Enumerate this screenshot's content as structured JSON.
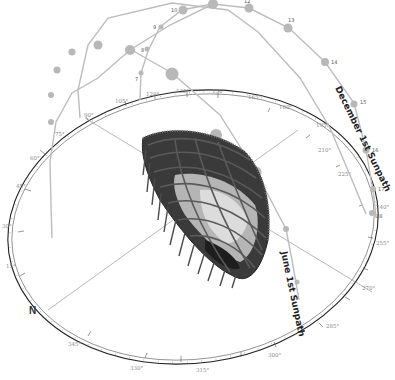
{
  "diagram": {
    "title_north": "N",
    "sunpaths": [
      {
        "name": "December 1st Sunpath",
        "label": "December 1st Sunpath",
        "color": "#bdbdbd"
      },
      {
        "name": "June 1st Sunpath",
        "label": "June 1st Sunpath",
        "color": "#bdbdbd"
      }
    ],
    "hour_labels": {
      "h7": "7",
      "h8": "8",
      "h9": "9",
      "h10": "10",
      "h12": "12",
      "h13": "13",
      "h14": "14",
      "h15": "15",
      "h16": "16",
      "h17": "17",
      "h18": "18"
    },
    "azimuth_labels": {
      "a15": "15°",
      "a30": "30°",
      "a45": "45°",
      "a60": "60°",
      "a75": "75°",
      "a90": "90°",
      "a105": "105°",
      "a120": "120°",
      "a135": "135°",
      "a150": "150°",
      "a165": "165°",
      "a180": "180°",
      "a195": "195°",
      "a210": "210°",
      "a225": "225°",
      "a240": "240°",
      "a255": "255°",
      "a270": "270°",
      "a285": "285°",
      "a300": "300°",
      "a315": "315°",
      "a330": "330°",
      "a345": "345°"
    },
    "colors": {
      "path_line": "#bdbdbd",
      "sun_node": "#b8b8b8",
      "compass_ring": "#222222",
      "axis_line": "#9a9a9a",
      "structure_dark": "#2a2a2a",
      "structure_mid": "#6a6a6a"
    }
  }
}
